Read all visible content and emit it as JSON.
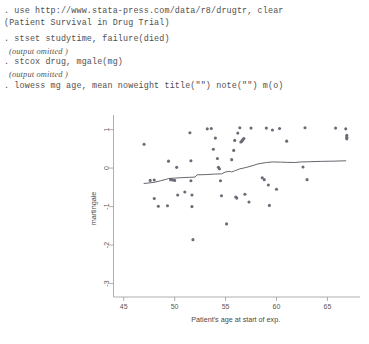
{
  "console": {
    "lines": [
      {
        "text": ". use http://www.stata-press.com/data/r8/drugtr, clear",
        "style": "cmd"
      },
      {
        "text": "(Patient Survival in Drug Trial)",
        "style": "cmd"
      },
      {
        "text": "",
        "style": "blank"
      },
      {
        "text": ". stset studytime, failure(died)",
        "style": "cmd"
      },
      {
        "text": "(output omitted )",
        "style": "omitted"
      },
      {
        "text": ". stcox drug, mgale(mg)",
        "style": "cmd"
      },
      {
        "text": "(output omitted )",
        "style": "omitted"
      },
      {
        "text": ". lowess mg age, mean noweight title(\"\") note(\"\") m(o)",
        "style": "cmd"
      }
    ]
  },
  "chart_data": {
    "type": "scatter",
    "title": "",
    "note": "",
    "xlabel": "Patient's age at start of exp.",
    "ylabel": "martingale",
    "xlim": [
      44.0,
      68.0
    ],
    "ylim": [
      -3.35,
      1.25
    ],
    "xticks": [
      45,
      50,
      55,
      60,
      65
    ],
    "yticks": [
      1,
      0,
      -1,
      -2,
      -3
    ],
    "xtick_labels": [
      "45",
      "50",
      "55",
      "60",
      "65"
    ],
    "ytick_labels": [
      "1",
      "0",
      "-1",
      "-2",
      "-3"
    ],
    "grid": false,
    "legend": false,
    "marker": "o",
    "marker_color": "#6b6b78",
    "line_color": "#55555f",
    "points": [
      [
        47.0,
        0.62
      ],
      [
        47.6,
        -0.32
      ],
      [
        48.0,
        -0.31
      ],
      [
        48.0,
        -0.79
      ],
      [
        48.4,
        -0.99
      ],
      [
        49.3,
        -0.98
      ],
      [
        49.4,
        0.18
      ],
      [
        49.6,
        -0.3
      ],
      [
        49.8,
        -0.31
      ],
      [
        50.0,
        -0.32
      ],
      [
        50.2,
        0.02
      ],
      [
        50.3,
        -0.7
      ],
      [
        51.0,
        -0.62
      ],
      [
        51.5,
        0.92
      ],
      [
        51.6,
        0.19
      ],
      [
        51.6,
        -0.33
      ],
      [
        51.7,
        -0.7
      ],
      [
        51.7,
        -1.0
      ],
      [
        51.8,
        -1.86
      ],
      [
        53.2,
        1.02
      ],
      [
        53.6,
        1.03
      ],
      [
        53.8,
        0.49
      ],
      [
        54.0,
        0.78
      ],
      [
        54.2,
        0.25
      ],
      [
        54.3,
        0.02
      ],
      [
        54.4,
        -0.02
      ],
      [
        54.5,
        -0.33
      ],
      [
        54.6,
        -0.72
      ],
      [
        55.1,
        -1.45
      ],
      [
        55.6,
        0.22
      ],
      [
        55.8,
        0.46
      ],
      [
        55.9,
        0.72
      ],
      [
        56.0,
        -0.75
      ],
      [
        56.1,
        -0.78
      ],
      [
        56.2,
        0.91
      ],
      [
        56.4,
        1.05
      ],
      [
        56.5,
        0.68
      ],
      [
        56.6,
        0.7
      ],
      [
        56.7,
        0.74
      ],
      [
        56.8,
        0.77
      ],
      [
        56.9,
        -0.68
      ],
      [
        57.3,
        -0.88
      ],
      [
        57.5,
        1.04
      ],
      [
        58.6,
        -0.25
      ],
      [
        58.8,
        -0.3
      ],
      [
        59.0,
        1.04
      ],
      [
        59.2,
        -0.44
      ],
      [
        59.3,
        -0.97
      ],
      [
        59.6,
        0.99
      ],
      [
        60.0,
        -0.55
      ],
      [
        60.3,
        1.03
      ],
      [
        61.0,
        0.7
      ],
      [
        62.6,
        0.03
      ],
      [
        62.8,
        1.05
      ],
      [
        63.0,
        -0.3
      ],
      [
        65.8,
        1.04
      ],
      [
        66.8,
        1.02
      ],
      [
        66.9,
        0.85
      ],
      [
        66.9,
        0.8
      ],
      [
        66.9,
        0.76
      ]
    ],
    "lowess": [
      [
        47.0,
        -0.4
      ],
      [
        48.0,
        -0.37
      ],
      [
        48.6,
        -0.33
      ],
      [
        49.2,
        -0.29
      ],
      [
        49.4,
        -0.27
      ],
      [
        50.0,
        -0.26
      ],
      [
        50.6,
        -0.25
      ],
      [
        51.4,
        -0.24
      ],
      [
        52.0,
        -0.235
      ],
      [
        52.2,
        -0.175
      ],
      [
        53.0,
        -0.17
      ],
      [
        54.0,
        -0.155
      ],
      [
        54.6,
        -0.15
      ],
      [
        55.0,
        -0.1
      ],
      [
        55.4,
        -0.085
      ],
      [
        55.6,
        -0.1
      ],
      [
        56.0,
        -0.06
      ],
      [
        56.4,
        -0.02
      ],
      [
        57.0,
        0.015
      ],
      [
        57.6,
        0.06
      ],
      [
        58.2,
        0.11
      ],
      [
        59.0,
        0.145
      ],
      [
        59.6,
        0.16
      ],
      [
        60.4,
        0.155
      ],
      [
        61.0,
        0.15
      ],
      [
        61.8,
        0.145
      ],
      [
        62.4,
        0.16
      ],
      [
        63.2,
        0.165
      ],
      [
        64.4,
        0.175
      ],
      [
        65.6,
        0.18
      ],
      [
        66.8,
        0.19
      ]
    ]
  }
}
